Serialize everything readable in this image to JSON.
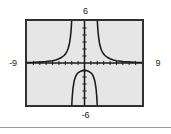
{
  "figure": {
    "kind": "graphing-calculator-plot",
    "background_color": "#ffffff",
    "plot_background_color": "#e6e6e6",
    "frame_color": "#303030",
    "curve_color": "#1a1a1a"
  },
  "labels": {
    "top": "6",
    "bottom": "-6",
    "left": "-9",
    "right": "9"
  },
  "separator": {
    "color": "#9a9a9a"
  },
  "chart_data": {
    "type": "line",
    "title": "",
    "xlabel": "",
    "ylabel": "",
    "xlim": [
      -9,
      9
    ],
    "ylim": [
      -6,
      6
    ],
    "grid": false,
    "legend": "none",
    "xticks": [
      -8,
      -7,
      -6,
      -5,
      -4,
      -3,
      -2,
      -1,
      0,
      1,
      2,
      3,
      4,
      5,
      6,
      7,
      8
    ],
    "yticks": [
      -5,
      -4,
      -3,
      -2,
      -1,
      0,
      1,
      2,
      3,
      4,
      5
    ],
    "xtick_labels": [
      "-9",
      "9"
    ],
    "ytick_labels": [
      "6",
      "-6"
    ],
    "axis_end_labels": {
      "xmin": "-9",
      "xmax": "9",
      "ymin": "-6",
      "ymax": "6"
    },
    "vertical_asymptotes": [
      -2,
      2
    ],
    "series": [
      {
        "name": "left branch",
        "x": [
          -9.0,
          -8.0,
          -7.0,
          -6.0,
          -5.0,
          -4.5,
          -4.0,
          -3.6,
          -3.2,
          -2.9,
          -2.7,
          -2.55,
          -2.4,
          -2.3,
          -2.22,
          -2.15,
          -2.1,
          -2.06,
          -2.03,
          -2.01
        ],
        "y": [
          0.08,
          0.1,
          0.14,
          0.2,
          0.32,
          0.43,
          0.6,
          0.79,
          1.07,
          1.4,
          1.75,
          2.1,
          2.6,
          3.1,
          3.6,
          4.2,
          4.7,
          5.2,
          5.7,
          6.0
        ]
      },
      {
        "name": "middle branch",
        "x": [
          -1.99,
          -1.95,
          -1.9,
          -1.8,
          -1.6,
          -1.4,
          -1.2,
          -1.0,
          -0.7,
          -0.4,
          0.0,
          0.4,
          0.7,
          1.0,
          1.2,
          1.4,
          1.6,
          1.8,
          1.9,
          1.95,
          1.99
        ],
        "y": [
          -6.0,
          -5.3,
          -4.6,
          -3.6,
          -2.5,
          -1.95,
          -1.6,
          -1.4,
          -1.22,
          -1.12,
          -1.1,
          -1.12,
          -1.22,
          -1.4,
          -1.6,
          -1.95,
          -2.5,
          -3.6,
          -4.6,
          -5.3,
          -6.0
        ]
      },
      {
        "name": "right branch",
        "x": [
          2.01,
          2.03,
          2.06,
          2.1,
          2.15,
          2.22,
          2.3,
          2.4,
          2.55,
          2.7,
          2.9,
          3.2,
          3.6,
          4.0,
          4.5,
          5.0,
          6.0,
          7.0,
          8.0,
          9.0
        ],
        "y": [
          6.0,
          5.7,
          5.2,
          4.7,
          4.2,
          3.6,
          3.1,
          2.6,
          2.1,
          1.75,
          1.4,
          1.07,
          0.79,
          0.6,
          0.43,
          0.32,
          0.2,
          0.14,
          0.1,
          0.08
        ]
      }
    ]
  }
}
